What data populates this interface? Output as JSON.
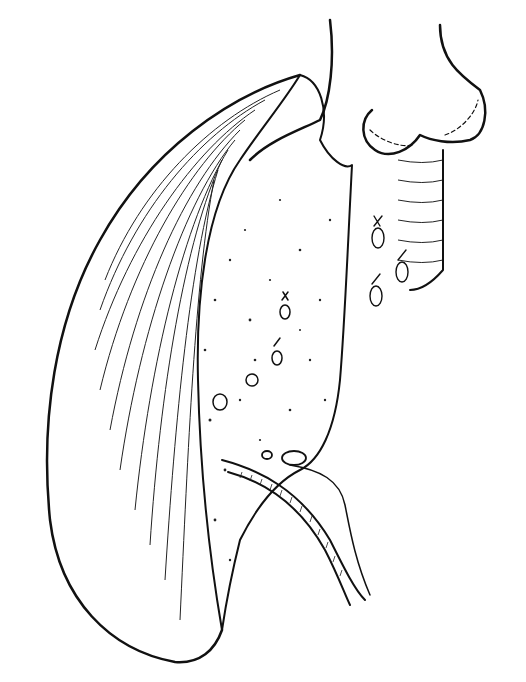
{
  "image": {
    "kind": "line-drawing illustration",
    "subject": "lung lobe with cut parenchymal surface, stapled/sutured bronchial stumps above, ligated vessels on cut surface, and hilar bronchovascular structure at bottom",
    "colors": {
      "background": "#ffffff",
      "ink": "#111111"
    },
    "text_labels": []
  }
}
